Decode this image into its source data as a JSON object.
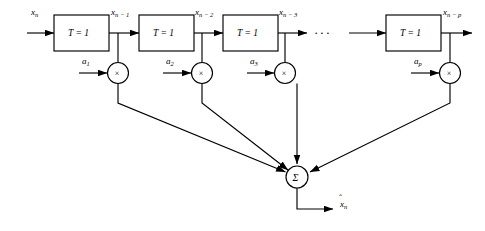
{
  "figure": {
    "type": "block-diagram",
    "input": {
      "label": "x",
      "subscript": "n"
    },
    "output": {
      "label": "x",
      "subscript": "n",
      "accent": "hat"
    },
    "ellipsis": "···",
    "delay_blocks": [
      {
        "id": "delay-1",
        "label": "T = 1",
        "output_label": "x",
        "output_subscript": "n − 1"
      },
      {
        "id": "delay-2",
        "label": "T = 1",
        "output_label": "x",
        "output_subscript": "n − 2"
      },
      {
        "id": "delay-3",
        "label": "T = 1",
        "output_label": "x",
        "output_subscript": "n − 3"
      },
      {
        "id": "delay-p",
        "label": "T = 1",
        "output_label": "x",
        "output_subscript": "n − p"
      }
    ],
    "multipliers": [
      {
        "id": "mult-1",
        "symbol": "×",
        "coefficient": "a",
        "coefficient_subscript": "1"
      },
      {
        "id": "mult-2",
        "symbol": "×",
        "coefficient": "a",
        "coefficient_subscript": "2"
      },
      {
        "id": "mult-3",
        "symbol": "×",
        "coefficient": "a",
        "coefficient_subscript": "3"
      },
      {
        "id": "mult-p",
        "symbol": "×",
        "coefficient": "a",
        "coefficient_subscript": "p"
      }
    ],
    "summer": {
      "id": "summing-junction",
      "symbol": "Σ"
    },
    "colors": {
      "stroke": "#000000",
      "background": "#ffffff"
    }
  }
}
